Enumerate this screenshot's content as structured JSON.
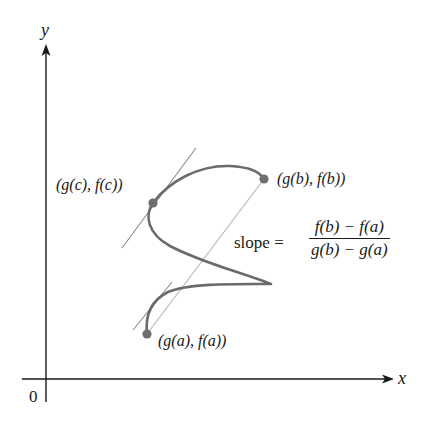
{
  "axes": {
    "x_label": "x",
    "y_label": "y",
    "origin_label": "0",
    "color": "#1a1a1a"
  },
  "curve": {
    "color": "#6b6b6b",
    "description": "parametric curve from (g(a), f(a)) to (g(b), f(b))"
  },
  "points": [
    {
      "id": "a",
      "label": "(g(a), f(a))",
      "x": 147,
      "y": 334
    },
    {
      "id": "c",
      "label": "(g(c), f(c))",
      "x": 153,
      "y": 203
    },
    {
      "id": "b",
      "label": "(g(b), f(b))",
      "x": 264,
      "y": 179
    }
  ],
  "point_color": "#6e6e6e",
  "secant_line": {
    "color": "#b5b5b5",
    "from": "a",
    "to": "b"
  },
  "tangent_lines": [
    {
      "at": "c",
      "color": "#8a8a8a"
    },
    {
      "at": "a",
      "color": "#8a8a8a"
    }
  ],
  "slope_formula": {
    "prefix": "slope =",
    "numerator": "f(b) − f(a)",
    "denominator": "g(b) − g(a)"
  }
}
